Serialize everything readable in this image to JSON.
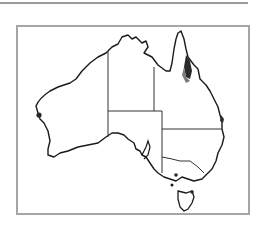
{
  "map": {
    "title": "Australia distribution map",
    "region": "Australia",
    "states": [
      "Western Australia",
      "Northern Territory",
      "Queensland",
      "South Australia",
      "New South Wales",
      "Victoria",
      "Tasmania"
    ],
    "colors": {
      "outline": "#1a1a1a",
      "border": "#333333",
      "frame": "#a6a6a6",
      "rule": "#9a9a9a",
      "distribution_dark": "#2a2a2a",
      "distribution_mid": "#7a7a7a"
    },
    "distribution_areas": [
      {
        "name": "north-east-queensland-coast",
        "shade": "dark"
      },
      {
        "name": "central-queensland-coast",
        "shade": "dark"
      },
      {
        "name": "south-west-western-australia-coast",
        "shade": "dark"
      },
      {
        "name": "southern-victoria-coast",
        "shade": "dark"
      },
      {
        "name": "north-tasmania",
        "shade": "dark"
      }
    ]
  }
}
